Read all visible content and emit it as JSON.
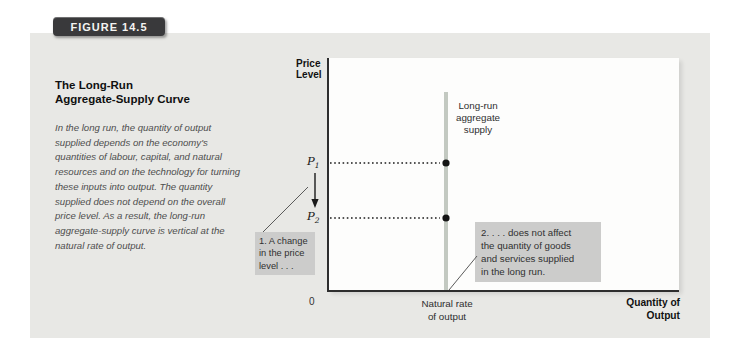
{
  "figure": {
    "badge_label": "FIGURE 14.5",
    "title_lines": [
      "The Long-Run",
      "Aggregate-Supply Curve"
    ],
    "caption": "In the long run, the quantity of output supplied depends on the economy's quantities of labour, capital, and natural resources and on the technology for turning these inputs into output. The quantity supplied does not depend on the overall price level. As a result, the long-run aggregate-supply curve is vertical at the natural rate of output."
  },
  "chart": {
    "type": "economic-diagram",
    "y_axis_label_lines": [
      "Price",
      "Level"
    ],
    "x_axis_label_lines": [
      "Quantity of",
      "Output"
    ],
    "origin_label": "0",
    "curve": {
      "label_lines": [
        "Long-run",
        "aggregate",
        "supply"
      ],
      "x_position_label_lines": [
        "Natural rate",
        "of output"
      ],
      "shape": "vertical"
    },
    "price_points": [
      {
        "base": "P",
        "sub": "1"
      },
      {
        "base": "P",
        "sub": "2"
      }
    ],
    "annotations": [
      {
        "lines": [
          "1. A change",
          "in the price",
          "level . . ."
        ]
      },
      {
        "lines": [
          "2. . . . does not affect",
          "the quantity of goods",
          "and services supplied",
          "in the long run."
        ]
      }
    ],
    "colors": {
      "panel_bg": "#e8e8e5",
      "badge_bg": "#39393b",
      "lras_line": "#c3c9c1",
      "annotation_bg": "#cccccb",
      "axis": "#2e2e2e"
    }
  }
}
